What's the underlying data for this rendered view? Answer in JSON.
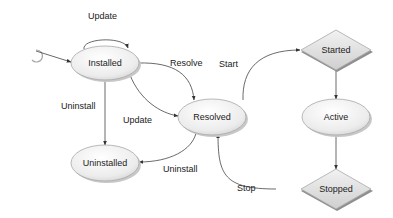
{
  "diagram": {
    "type": "state-machine",
    "nodes": {
      "installed": {
        "label": "Installed",
        "shape": "ellipse"
      },
      "uninstalled": {
        "label": "Uninstalled",
        "shape": "ellipse"
      },
      "resolved": {
        "label": "Resolved",
        "shape": "ellipse"
      },
      "active": {
        "label": "Active",
        "shape": "ellipse"
      },
      "started": {
        "label": "Started",
        "shape": "diamond"
      },
      "stopped": {
        "label": "Stopped",
        "shape": "diamond"
      }
    },
    "edges": {
      "update_self": {
        "label": "Update",
        "from": "Installed",
        "to": "Installed"
      },
      "resolve": {
        "label": "Resolve",
        "from": "Installed",
        "to": "Resolved"
      },
      "update_resolved": {
        "label": "Update",
        "from": "Resolved",
        "to": "Installed"
      },
      "uninstall_installed": {
        "label": "Uninstall",
        "from": "Installed",
        "to": "Uninstalled"
      },
      "uninstall_resolved": {
        "label": "Uninstall",
        "from": "Resolved",
        "to": "Uninstalled"
      },
      "start": {
        "label": "Start",
        "from": "Resolved",
        "to": "Started"
      },
      "started_active": {
        "label": "",
        "from": "Started",
        "to": "Active"
      },
      "active_stopped": {
        "label": "",
        "from": "Active",
        "to": "Stopped"
      },
      "stop": {
        "label": "Stop",
        "from": "Stopped",
        "to": "Resolved"
      }
    },
    "colors": {
      "node_fill_light": "#ffffff",
      "node_fill_dark": "#d9d9d9",
      "node_stroke": "#9a9a9a",
      "edge": "#444444",
      "shadow": "#bdbdbd"
    }
  }
}
